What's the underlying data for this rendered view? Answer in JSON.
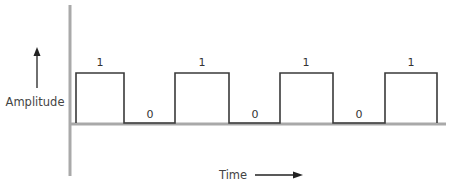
{
  "diagram": {
    "y_axis_label": "Amplitude",
    "x_axis_label": "Time",
    "colors": {
      "axis": "#a9a9a9",
      "signal": "#3a3a3a",
      "text": "#444444",
      "background": "#ffffff"
    },
    "bits": [
      {
        "value": "1",
        "label": "1"
      },
      {
        "value": "0",
        "label": "0"
      },
      {
        "value": "1",
        "label": "1"
      },
      {
        "value": "0",
        "label": "0"
      },
      {
        "value": "1",
        "label": "1"
      },
      {
        "value": "0",
        "label": "0"
      },
      {
        "value": "1",
        "label": "1"
      }
    ],
    "bit_labels": [
      "1",
      "0",
      "1",
      "0",
      "1",
      "0",
      "1"
    ]
  }
}
